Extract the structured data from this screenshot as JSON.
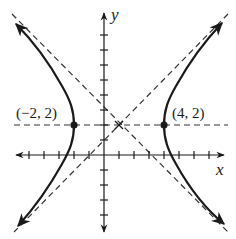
{
  "figure": {
    "type": "hyperbola-graph",
    "equation": "(x-1)^2/9 - (y-2)^2/9 = 1",
    "center": [
      1,
      2
    ],
    "x_axis_label": "x",
    "y_axis_label": "y",
    "points": [
      {
        "label": "(−2, 2)",
        "x": -2,
        "y": 2
      },
      {
        "label": "(4, 2)",
        "x": 4,
        "y": 2
      }
    ],
    "asymptotes": [
      "y - 2 = x - 1",
      "y - 2 = -(x - 1)"
    ],
    "horizontal_dashed_line": "y = 2",
    "x_ticks": [
      -6,
      -5,
      -4,
      -3,
      -2,
      -1,
      1,
      2,
      3,
      4,
      5,
      6,
      7,
      8
    ],
    "y_ticks": [
      -5,
      -4,
      -3,
      -2,
      -1,
      1,
      2,
      3,
      4,
      5,
      6,
      7,
      8
    ],
    "colors": {
      "ink": "#1a1a1a",
      "dash": "#333333",
      "background": "#ffffff"
    }
  }
}
